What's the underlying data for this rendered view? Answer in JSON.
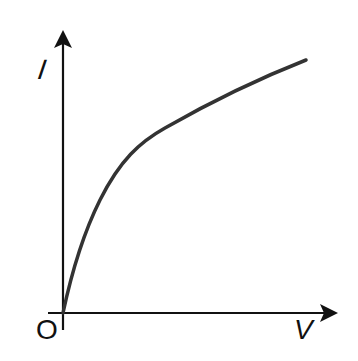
{
  "diagram": {
    "type": "I-V characteristic graph",
    "y_axis_label": "I",
    "x_axis_label": "V",
    "origin_label": "O",
    "curve_description": "Concave-down increasing curve starting at origin (current rises steeply at low voltage, then flattens)",
    "colors": {
      "axis": "#111111",
      "curve": "#333333",
      "background": "#ffffff"
    }
  }
}
